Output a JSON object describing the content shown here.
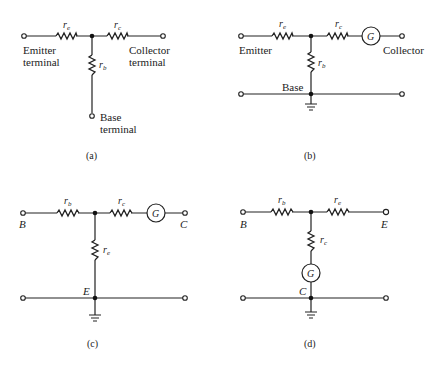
{
  "figure": {
    "panels": [
      {
        "caption": "(a)",
        "resistors": {
          "top_left": "r",
          "top_left_sub": "e",
          "top_right": "r",
          "top_right_sub": "c",
          "vertical": "r",
          "vertical_sub": "b"
        },
        "labels": {
          "left_1": "Emitter",
          "left_2": "terminal",
          "right_1": "Collector",
          "right_2": "terminal",
          "bottom_1": "Base",
          "bottom_2": "terminal"
        }
      },
      {
        "caption": "(b)",
        "resistors": {
          "top_left": "r",
          "top_left_sub": "e",
          "top_right": "r",
          "top_right_sub": "c",
          "vertical": "r",
          "vertical_sub": "b"
        },
        "generator": "G",
        "labels": {
          "left": "Emitter",
          "right": "Collector",
          "common": "Base"
        }
      },
      {
        "caption": "(c)",
        "resistors": {
          "top_left": "r",
          "top_left_sub": "b",
          "top_right": "r",
          "top_right_sub": "c",
          "vertical": "r",
          "vertical_sub": "e"
        },
        "generator": "G",
        "labels": {
          "left": "B",
          "right": "C",
          "common": "E"
        }
      },
      {
        "caption": "(d)",
        "resistors": {
          "top_left": "r",
          "top_left_sub": "b",
          "top_right": "r",
          "top_right_sub": "e",
          "vertical": "r",
          "vertical_sub": "c"
        },
        "generator": "G",
        "labels": {
          "left": "B",
          "right": "E",
          "common": "C"
        }
      }
    ]
  }
}
